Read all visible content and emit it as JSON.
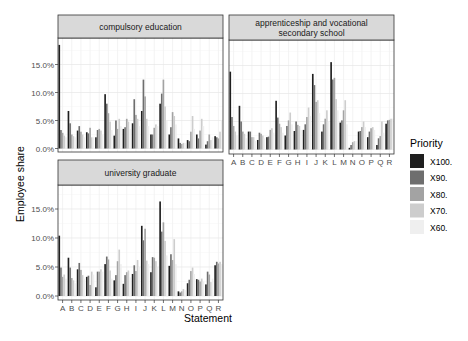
{
  "chart_data": {
    "type": "bar",
    "layout": "faceted grouped bar chart (3 panels, 2x2 grid, shared y axis)",
    "xlabel": "Statement",
    "ylabel": "Employee share",
    "y_ticks": [
      "0.0%",
      "5.0%",
      "10.0%",
      "15.0%"
    ],
    "ylim": [
      0,
      19
    ],
    "grid": true,
    "legend": {
      "title": "Priority",
      "position": "right",
      "entries": [
        {
          "label": "X100.",
          "color": "#1f1f1f"
        },
        {
          "label": "X90.",
          "color": "#6e6e6e"
        },
        {
          "label": "X80.",
          "color": "#a3a3a3"
        },
        {
          "label": "X70.",
          "color": "#cdcdcd"
        },
        {
          "label": "X60.",
          "color": "#efefef"
        }
      ]
    },
    "categories": [
      "A",
      "B",
      "C",
      "D",
      "E",
      "F",
      "G",
      "H",
      "I",
      "J",
      "K",
      "L",
      "M",
      "N",
      "O",
      "P",
      "Q",
      "R"
    ],
    "panels": [
      {
        "title_lines": [
          "compulsory education"
        ],
        "series": [
          {
            "name": "X100.",
            "values": [
              18.5,
              6.7,
              3.2,
              2.9,
              2.0,
              9.7,
              2.3,
              3.5,
              4.5,
              6.7,
              2.5,
              8.0,
              2.5,
              1.8,
              1.5,
              2.5,
              0.7,
              2.2
            ]
          },
          {
            "name": "X90.",
            "values": [
              3.3,
              4.5,
              4.0,
              2.7,
              3.3,
              8.0,
              5.0,
              3.8,
              8.8,
              12.3,
              2.5,
              9.8,
              3.8,
              1.0,
              1.3,
              1.8,
              1.3,
              2.0
            ]
          },
          {
            "name": "X80.",
            "values": [
              2.8,
              2.5,
              3.0,
              3.7,
              3.5,
              6.3,
              3.5,
              5.3,
              6.0,
              9.3,
              3.7,
              12.3,
              6.5,
              0.8,
              3.0,
              3.2,
              2.5,
              1.8
            ]
          },
          {
            "name": "X70.",
            "values": [
              2.3,
              2.2,
              2.5,
              2.0,
              3.2,
              4.8,
              5.3,
              4.8,
              5.3,
              5.3,
              4.3,
              7.5,
              5.8,
              1.0,
              5.8,
              5.3,
              1.5,
              3.0
            ]
          },
          {
            "name": "X60.",
            "values": [
              2.0,
              2.0,
              2.0,
              2.0,
              2.5,
              3.3,
              4.0,
              3.5,
              4.0,
              4.0,
              4.0,
              5.0,
              4.3,
              1.0,
              3.5,
              4.0,
              2.0,
              5.0
            ]
          }
        ]
      },
      {
        "title_lines": [
          "apprenticeship and vocational",
          "secondary school"
        ],
        "series": [
          {
            "name": "X100.",
            "values": [
              13.9,
              7.8,
              3.2,
              1.7,
              2.2,
              8.7,
              2.5,
              3.3,
              3.5,
              13.5,
              3.2,
              15.6,
              4.8,
              0.3,
              3.2,
              2.2,
              0.8,
              4.6
            ]
          },
          {
            "name": "X90.",
            "values": [
              5.8,
              5.0,
              3.2,
              3.0,
              2.3,
              5.7,
              4.2,
              5.0,
              4.5,
              11.5,
              4.5,
              12.5,
              5.2,
              0.8,
              3.3,
              3.2,
              2.0,
              5.2
            ]
          },
          {
            "name": "X80.",
            "values": [
              4.2,
              3.2,
              2.2,
              2.8,
              3.5,
              4.6,
              5.2,
              4.4,
              5.8,
              8.5,
              5.5,
              12.8,
              7.0,
              1.3,
              4.0,
              3.8,
              2.4,
              5.3
            ]
          },
          {
            "name": "X70.",
            "values": [
              3.2,
              2.8,
              2.2,
              2.5,
              3.8,
              4.0,
              6.6,
              4.2,
              7.5,
              8.8,
              7.0,
              9.0,
              8.8,
              1.5,
              5.0,
              4.0,
              5.0,
              5.5
            ]
          },
          {
            "name": "X60.",
            "values": [
              2.5,
              2.0,
              1.5,
              2.0,
              3.0,
              3.0,
              4.5,
              3.5,
              6.0,
              6.5,
              5.0,
              7.0,
              4.5,
              1.5,
              4.0,
              3.5,
              3.0,
              5.5
            ]
          }
        ]
      },
      {
        "title_lines": [
          "university graduate"
        ],
        "series": [
          {
            "name": "X100.",
            "values": [
              10.4,
              6.6,
              4.6,
              3.3,
              1.5,
              5.5,
              2.7,
              2.1,
              3.8,
              12.1,
              4.1,
              16.3,
              5.2,
              0.8,
              2.2,
              2.9,
              2.0,
              5.3
            ]
          },
          {
            "name": "X90.",
            "values": [
              4.9,
              4.9,
              5.7,
              3.5,
              4.2,
              6.8,
              3.6,
              3.6,
              5.3,
              9.6,
              6.7,
              11.1,
              7.2,
              0.6,
              2.8,
              2.8,
              4.2,
              5.9
            ]
          },
          {
            "name": "X80.",
            "values": [
              3.3,
              3.1,
              4.5,
              1.9,
              4.2,
              6.3,
              6.0,
              4.1,
              4.3,
              11.6,
              6.6,
              12.7,
              6.2,
              0.8,
              4.3,
              2.5,
              3.7,
              5.6
            ]
          },
          {
            "name": "X70.",
            "values": [
              3.7,
              2.7,
              3.6,
              4.2,
              4.6,
              4.4,
              8.0,
              4.4,
              6.2,
              6.1,
              6.0,
              9.5,
              9.8,
              1.2,
              4.9,
              3.0,
              2.4,
              5.9
            ]
          },
          {
            "name": "X60.",
            "values": [
              3.0,
              2.2,
              3.0,
              3.7,
              4.2,
              3.0,
              5.5,
              3.2,
              5.0,
              5.5,
              5.0,
              7.0,
              5.5,
              1.0,
              3.8,
              2.5,
              3.0,
              5.5
            ]
          }
        ]
      }
    ]
  }
}
